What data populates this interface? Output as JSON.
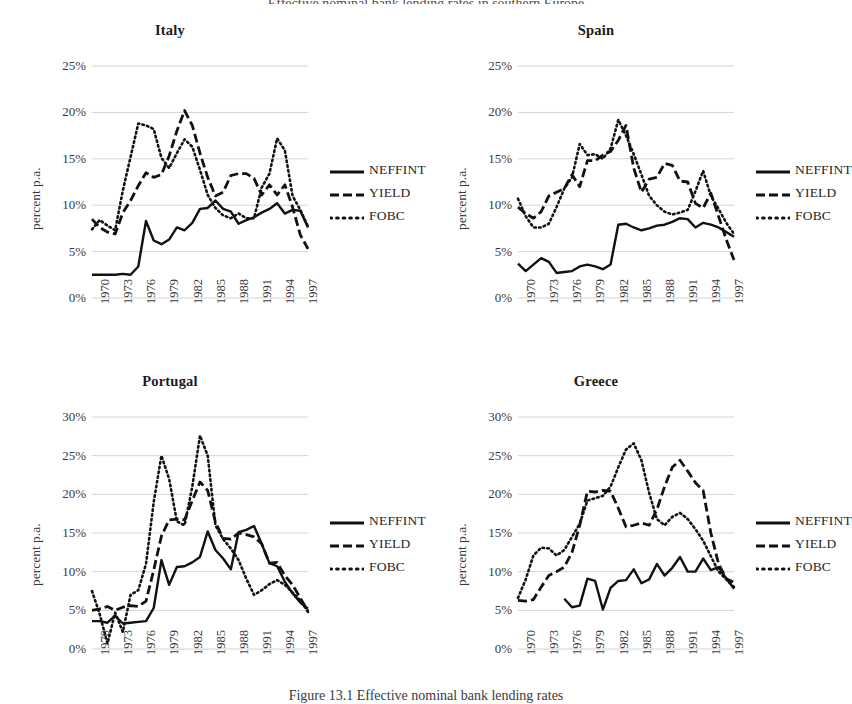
{
  "figure": {
    "caption": "Figure 13.1   Effective nominal bank lending rates",
    "header_fragment": "Effective nominal bank lending rates in southern Europe",
    "ylabel": "percent p.a."
  },
  "legend": {
    "entries": [
      {
        "label": "NEFFINT",
        "style": "solid"
      },
      {
        "label": "YIELD",
        "style": "dashed"
      },
      {
        "label": "FOBC",
        "style": "dotted"
      }
    ]
  },
  "axis": {
    "xticks": [
      "1970",
      "1973",
      "1976",
      "1979",
      "1982",
      "1985",
      "1988",
      "1991",
      "1994",
      "1997"
    ],
    "yticks_25": [
      "0%",
      "5%",
      "10%",
      "15%",
      "20%",
      "25%"
    ],
    "yticks_30": [
      "0%",
      "5%",
      "10%",
      "15%",
      "20%",
      "25%",
      "30%"
    ]
  },
  "chart_data": [
    {
      "type": "line",
      "title": "Italy",
      "xlabel": "",
      "ylabel": "percent p.a.",
      "xlim": [
        1970,
        1998
      ],
      "ylim": [
        0,
        25
      ],
      "ytick_step": 5,
      "grid": true,
      "legend_position": "right",
      "x": [
        1970,
        1971,
        1972,
        1973,
        1974,
        1975,
        1976,
        1977,
        1978,
        1979,
        1980,
        1981,
        1982,
        1983,
        1984,
        1985,
        1986,
        1987,
        1988,
        1989,
        1990,
        1991,
        1992,
        1993,
        1994,
        1995,
        1996,
        1997,
        1998
      ],
      "series": [
        {
          "name": "NEFFINT",
          "style": "solid",
          "values": [
            2.5,
            2.5,
            2.5,
            2.5,
            2.6,
            2.5,
            3.4,
            8.3,
            6.2,
            5.8,
            6.3,
            7.6,
            7.3,
            8.1,
            9.6,
            9.7,
            10.5,
            9.6,
            9.3,
            8.0,
            8.4,
            8.7,
            9.2,
            9.6,
            10.2,
            9.1,
            9.5,
            9.4,
            7.6
          ]
        },
        {
          "name": "YIELD",
          "style": "dashed",
          "values": [
            8.5,
            7.6,
            7.1,
            6.9,
            9.2,
            10.5,
            12.1,
            13.5,
            13.0,
            13.3,
            15.3,
            18.0,
            20.2,
            18.6,
            15.6,
            13.0,
            11.0,
            11.4,
            13.2,
            13.4,
            13.4,
            12.9,
            11.1,
            12.2,
            11.1,
            12.2,
            9.8,
            6.8,
            5.3
          ]
        },
        {
          "name": "FOBC",
          "style": "dotted",
          "values": [
            7.4,
            8.4,
            7.8,
            7.3,
            11.6,
            15.2,
            18.8,
            18.6,
            18.2,
            15.1,
            14.0,
            15.6,
            17.1,
            16.3,
            13.8,
            11.1,
            9.7,
            8.9,
            8.6,
            9.1,
            8.6,
            8.6,
            11.9,
            13.4,
            17.2,
            15.9,
            11.0,
            9.5,
            7.7
          ]
        }
      ]
    },
    {
      "type": "line",
      "title": "Spain",
      "xlabel": "",
      "ylabel": "percent p.a.",
      "xlim": [
        1970,
        1998
      ],
      "ylim": [
        0,
        25
      ],
      "ytick_step": 5,
      "grid": true,
      "legend_position": "right",
      "x": [
        1970,
        1971,
        1972,
        1973,
        1974,
        1975,
        1976,
        1977,
        1978,
        1979,
        1980,
        1981,
        1982,
        1983,
        1984,
        1985,
        1986,
        1987,
        1988,
        1989,
        1990,
        1991,
        1992,
        1993,
        1994,
        1995,
        1996,
        1997,
        1998
      ],
      "series": [
        {
          "name": "NEFFINT",
          "style": "solid",
          "values": [
            3.7,
            2.9,
            3.6,
            4.3,
            3.9,
            2.7,
            2.8,
            2.9,
            3.4,
            3.6,
            3.4,
            3.1,
            3.6,
            7.9,
            8.0,
            7.6,
            7.3,
            7.5,
            7.8,
            7.9,
            8.2,
            8.6,
            8.5,
            7.6,
            8.1,
            7.9,
            7.6,
            7.1,
            6.6
          ]
        },
        {
          "name": "YIELD",
          "style": "dashed",
          "values": [
            9.8,
            9.1,
            8.6,
            9.3,
            11.0,
            11.4,
            11.8,
            13.3,
            12.0,
            14.8,
            14.8,
            15.4,
            15.8,
            17.0,
            18.6,
            14.0,
            11.4,
            12.8,
            13.0,
            14.5,
            14.3,
            12.6,
            12.5,
            10.2,
            9.7,
            11.3,
            8.8,
            6.3,
            4.1
          ]
        },
        {
          "name": "FOBC",
          "style": "dotted",
          "values": [
            10.7,
            8.8,
            7.6,
            7.6,
            8.0,
            9.8,
            11.8,
            13.0,
            16.6,
            15.4,
            15.5,
            15.0,
            16.1,
            19.2,
            17.5,
            15.5,
            13.3,
            11.0,
            10.0,
            9.3,
            9.0,
            9.2,
            9.5,
            11.5,
            13.7,
            11.0,
            9.6,
            8.1,
            6.9
          ]
        }
      ]
    },
    {
      "type": "line",
      "title": "Portugal",
      "xlabel": "",
      "ylabel": "percent p.a.",
      "xlim": [
        1970,
        1998
      ],
      "ylim": [
        0,
        30
      ],
      "ytick_step": 5,
      "grid": true,
      "legend_position": "right",
      "x": [
        1970,
        1971,
        1972,
        1973,
        1974,
        1975,
        1976,
        1977,
        1978,
        1979,
        1980,
        1981,
        1982,
        1983,
        1984,
        1985,
        1986,
        1987,
        1988,
        1989,
        1990,
        1991,
        1992,
        1993,
        1994,
        1995,
        1996,
        1997,
        1998
      ],
      "series": [
        {
          "name": "NEFFINT",
          "style": "solid",
          "values": [
            3.6,
            3.6,
            3.4,
            4.3,
            3.3,
            3.4,
            3.5,
            3.6,
            5.3,
            11.5,
            8.3,
            10.6,
            10.7,
            11.2,
            11.9,
            15.2,
            12.8,
            11.7,
            10.3,
            15.1,
            15.4,
            15.9,
            13.6,
            11.1,
            10.7,
            8.7,
            7.2,
            6.0,
            5.2
          ]
        },
        {
          "name": "YIELD",
          "style": "dashed",
          "values": [
            5.0,
            5.2,
            5.5,
            5.0,
            5.4,
            5.6,
            5.5,
            6.2,
            10.2,
            14.6,
            16.7,
            16.8,
            16.7,
            19.2,
            21.6,
            20.5,
            16.4,
            14.3,
            14.2,
            15.0,
            14.8,
            14.5,
            13.6,
            11.1,
            11.2,
            9.5,
            8.3,
            6.6,
            4.9
          ]
        },
        {
          "name": "FOBC",
          "style": "dotted",
          "values": [
            7.5,
            4.5,
            0.7,
            4.7,
            2.2,
            7.0,
            7.6,
            11.0,
            19.0,
            25.0,
            22.0,
            16.5,
            16.0,
            21.0,
            27.6,
            25.0,
            16.0,
            14.2,
            13.0,
            11.5,
            9.1,
            7.0,
            7.6,
            8.4,
            8.9,
            8.3,
            7.3,
            6.3,
            4.8
          ]
        }
      ]
    },
    {
      "type": "line",
      "title": "Greece",
      "xlabel": "",
      "ylabel": "percent p.a.",
      "xlim": [
        1970,
        1998
      ],
      "ylim": [
        0,
        30
      ],
      "ytick_step": 5,
      "grid": true,
      "legend_position": "right",
      "x": [
        1970,
        1971,
        1972,
        1973,
        1974,
        1975,
        1976,
        1977,
        1978,
        1979,
        1980,
        1981,
        1982,
        1983,
        1984,
        1985,
        1986,
        1987,
        1988,
        1989,
        1990,
        1991,
        1992,
        1993,
        1994,
        1995,
        1996,
        1997,
        1998
      ],
      "series": [
        {
          "name": "NEFFINT",
          "style": "solid",
          "values": [
            null,
            null,
            null,
            null,
            null,
            null,
            6.5,
            5.4,
            5.6,
            9.1,
            8.8,
            5.1,
            7.9,
            8.8,
            8.9,
            10.3,
            8.5,
            9.0,
            11.0,
            9.5,
            10.5,
            11.9,
            10.0,
            10.0,
            11.7,
            10.2,
            10.6,
            9.1,
            7.8
          ]
        },
        {
          "name": "YIELD",
          "style": "dashed",
          "values": [
            6.3,
            6.2,
            6.4,
            8.0,
            9.5,
            10.0,
            10.6,
            12.5,
            16.0,
            20.4,
            20.3,
            20.5,
            20.4,
            18.2,
            15.8,
            16.0,
            16.3,
            16.0,
            18.0,
            21.0,
            23.5,
            24.4,
            23.0,
            21.5,
            20.5,
            15.0,
            11.0,
            9.1,
            8.6
          ]
        },
        {
          "name": "FOBC",
          "style": "dotted",
          "values": [
            6.6,
            9.0,
            12.1,
            13.1,
            13.0,
            12.1,
            12.8,
            14.5,
            16.2,
            19.2,
            19.5,
            19.8,
            21.0,
            23.5,
            25.8,
            26.6,
            24.4,
            20.2,
            16.8,
            16.0,
            17.1,
            17.6,
            16.8,
            15.5,
            14.0,
            12.0,
            10.0,
            9.0,
            8.0
          ]
        }
      ]
    }
  ]
}
